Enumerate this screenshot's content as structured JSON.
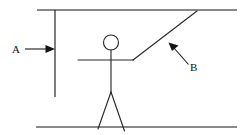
{
  "diagram": {
    "type": "line-drawing",
    "background_color": "#ffffff",
    "line_color": "#141414",
    "width": 243,
    "height": 135,
    "labels": [
      {
        "id": "label-a",
        "text": "A",
        "x": 12,
        "y": 53,
        "points_to": "vertical-wall-line",
        "arrow": {
          "from_x": 25,
          "from_y": 49,
          "to_x": 55,
          "to_y": 49,
          "direction": "right"
        }
      },
      {
        "id": "label-b",
        "text": "B",
        "x": 190,
        "y": 71,
        "points_to": "diagonal-arm-line",
        "arrow": {
          "from_x": 188,
          "from_y": 64,
          "to_x": 169,
          "to_y": 43,
          "direction": "up-left"
        }
      }
    ],
    "shapes": {
      "top_horizontal_line": {
        "x1": 37,
        "y1": 10,
        "x2": 237,
        "y2": 10
      },
      "bottom_horizontal_line": {
        "x1": 36,
        "y1": 127,
        "x2": 237,
        "y2": 127
      },
      "vertical_wall_line": {
        "x1": 55,
        "y1": 10,
        "x2": 55,
        "y2": 97
      },
      "diagonal_line": {
        "x1": 133,
        "y1": 60,
        "x2": 197,
        "y2": 11
      },
      "figure_head": {
        "cx": 111,
        "cy": 42.5,
        "r": 7.5
      },
      "figure_body": {
        "x1": 111,
        "y1": 50,
        "x2": 111,
        "y2": 92
      },
      "figure_arm": {
        "x1": 78,
        "y1": 60,
        "x2": 133,
        "y2": 60
      },
      "figure_leg_left": {
        "x1": 111,
        "y1": 92,
        "x2": 98,
        "y2": 129
      },
      "figure_leg_right": {
        "x1": 111,
        "y1": 92,
        "x2": 124,
        "y2": 131
      }
    }
  }
}
